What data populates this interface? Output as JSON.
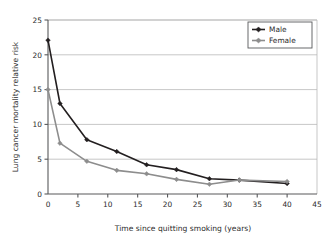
{
  "chart_data": {
    "type": "line",
    "title": "",
    "xlabel": "Time since quitting smoking (years)",
    "ylabel": "Lung cancer mortality relative risk",
    "xlim": [
      0,
      45
    ],
    "ylim": [
      0,
      25
    ],
    "xticks": [
      "0",
      "5",
      "10",
      "15",
      "20",
      "25",
      "30",
      "35",
      "40",
      "45"
    ],
    "yticks": [
      "0",
      "5",
      "10",
      "15",
      "20",
      "25"
    ],
    "grid": "horizontal",
    "legend_position": "top-right",
    "x": [
      0,
      2,
      6.5,
      11.5,
      16.5,
      21.5,
      27,
      32,
      40
    ],
    "series": [
      {
        "name": "Male",
        "color": "#231f20",
        "marker": "diamond",
        "values": [
          22.1,
          13.0,
          7.8,
          6.1,
          4.2,
          3.5,
          2.2,
          2.0,
          1.5
        ]
      },
      {
        "name": "Female",
        "color": "#8d8d8d",
        "marker": "diamond",
        "values": [
          15.0,
          7.3,
          4.7,
          3.4,
          2.9,
          2.1,
          1.4,
          2.0,
          1.8
        ]
      }
    ]
  },
  "colors": {
    "male": "#231f20",
    "female": "#8d8d8d",
    "grid": "#b9b9b9",
    "axis": "#58595b",
    "background": "#ffffff",
    "text": "#2b2b2b"
  },
  "legend": {
    "entries": [
      {
        "label": "Male"
      },
      {
        "label": "Female"
      }
    ]
  }
}
